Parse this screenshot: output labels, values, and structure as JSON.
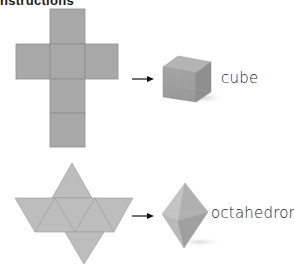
{
  "header": {
    "title": "Instructions"
  },
  "examples": [
    {
      "net": "cross of six squares",
      "arrow": "right-arrow-icon",
      "solid_label": "cube"
    },
    {
      "net": "eight equilateral triangles",
      "arrow": "right-arrow-icon",
      "solid_label": "octahedron"
    }
  ],
  "colors": {
    "net_fill": "#a9a9a9",
    "net_edge": "#8c8c8c",
    "tri_fill": "#bcbcbc",
    "background": "#ffffff"
  }
}
